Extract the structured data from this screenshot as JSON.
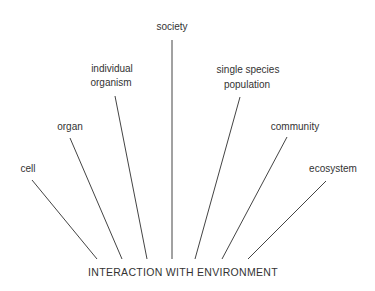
{
  "diagram": {
    "base_label": "INTERACTION WITH ENVIRONMENT",
    "levels": [
      {
        "id": "cell",
        "lines": [
          "cell"
        ]
      },
      {
        "id": "organ",
        "lines": [
          "organ"
        ]
      },
      {
        "id": "individual-organism",
        "lines": [
          "individual",
          "organism"
        ]
      },
      {
        "id": "society",
        "lines": [
          "society"
        ]
      },
      {
        "id": "single-species-population",
        "lines": [
          "single species",
          "population"
        ]
      },
      {
        "id": "community",
        "lines": [
          "community"
        ]
      },
      {
        "id": "ecosystem",
        "lines": [
          "ecosystem"
        ]
      }
    ],
    "line_color": "#444444",
    "text_color": "#333333"
  }
}
